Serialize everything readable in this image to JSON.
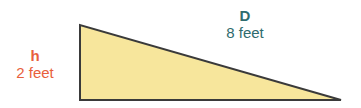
{
  "diagram": {
    "shape": "right-triangle",
    "fill_color": "#f7e69c",
    "stroke_color": "#3a3a3a",
    "height_label": {
      "variable": "h",
      "value": "2 feet",
      "color": "#e8603c"
    },
    "distance_label": {
      "variable": "D",
      "value": "8 feet",
      "color": "#2f6b6e"
    }
  }
}
